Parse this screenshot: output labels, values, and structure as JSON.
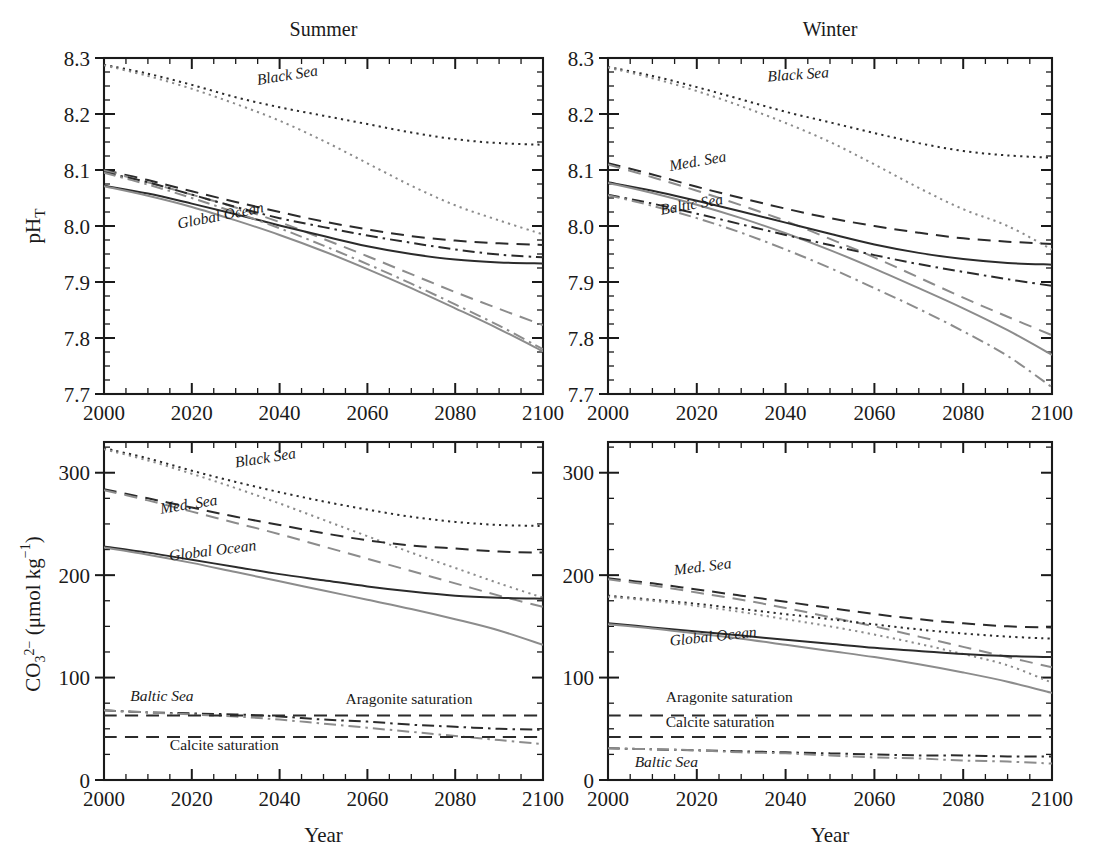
{
  "figure": {
    "panels": [
      {
        "id": "summer-ph",
        "title": "Summer",
        "x_axis_label": "",
        "y_axis_label": "pH_T"
      },
      {
        "id": "winter-ph",
        "title": "Winter",
        "x_axis_label": "",
        "y_axis_label": ""
      },
      {
        "id": "summer-co3",
        "title": "",
        "x_axis_label": "Year",
        "y_axis_label": "CO3 2- (umol kg-1)"
      },
      {
        "id": "winter-co3",
        "title": "",
        "x_axis_label": "Year",
        "y_axis_label": ""
      }
    ],
    "axis_titles": {
      "year": "Year",
      "ph": "pH",
      "ph_sub": "T",
      "co3": "CO",
      "co3_sup": "2−",
      "co3_sub": "3",
      "co3_units": "(μmol kg",
      "co3_units_sup": "−1",
      "co3_units_close": ")"
    },
    "colors": {
      "dark": "#2b2b2b",
      "light": "#8c8c8c",
      "axis": "#1a1a1a",
      "background": "#ffffff"
    }
  },
  "chart_data": [
    {
      "type": "line",
      "id": "summer-ph",
      "title": "Summer",
      "xlabel": "",
      "ylabel": "pH_T",
      "xlim": [
        2000,
        2100
      ],
      "ylim": [
        7.7,
        8.3
      ],
      "xticks": [
        2000,
        2020,
        2040,
        2060,
        2080,
        2100
      ],
      "yticks": [
        7.7,
        7.8,
        7.9,
        8.0,
        8.1,
        8.2,
        8.3
      ],
      "ytick_labels": [
        "7.7",
        "7.8",
        "7.9",
        "8.0",
        "8.1",
        "8.2",
        "8.3"
      ],
      "xtick_labels": [
        "2000",
        "2020",
        "2040",
        "2060",
        "2080",
        "2100"
      ],
      "minor_tick_step": 5,
      "grid": false,
      "legend": "inline-annotations",
      "annotations": [
        {
          "text": "Black Sea",
          "x": 2035,
          "y": 8.252,
          "rotation": -9,
          "style": "italic"
        },
        {
          "text": "Global Ocean",
          "x": 2017,
          "y": 7.995,
          "rotation": -11,
          "style": "italic"
        }
      ],
      "x": [
        2000,
        2010,
        2020,
        2030,
        2040,
        2050,
        2060,
        2070,
        2080,
        2090,
        2100
      ],
      "series": [
        {
          "name": "Black Sea (scenario A)",
          "style": "dotted",
          "shade": "dark",
          "values": [
            8.288,
            8.272,
            8.252,
            8.23,
            8.212,
            8.197,
            8.182,
            8.167,
            8.155,
            8.148,
            8.145
          ]
        },
        {
          "name": "Black Sea (scenario B)",
          "style": "dotted",
          "shade": "light",
          "values": [
            8.287,
            8.268,
            8.245,
            8.218,
            8.188,
            8.152,
            8.112,
            8.072,
            8.037,
            8.01,
            7.985
          ]
        },
        {
          "name": "Med. Sea (scenario A)",
          "style": "dashed",
          "shade": "dark",
          "values": [
            8.1,
            8.082,
            8.062,
            8.043,
            8.025,
            8.008,
            7.994,
            7.982,
            7.974,
            7.969,
            7.966
          ]
        },
        {
          "name": "Med. Sea (scenario B)",
          "style": "dashed",
          "shade": "light",
          "values": [
            8.099,
            8.078,
            8.056,
            8.033,
            8.007,
            7.977,
            7.946,
            7.914,
            7.882,
            7.852,
            7.823
          ]
        },
        {
          "name": "Global Ocean (scenario A)",
          "style": "solid",
          "shade": "dark",
          "values": [
            8.072,
            8.058,
            8.04,
            8.021,
            8.001,
            7.982,
            7.964,
            7.95,
            7.94,
            7.935,
            7.933
          ]
        },
        {
          "name": "Global Ocean (scenario B)",
          "style": "solid",
          "shade": "light",
          "values": [
            8.071,
            8.054,
            8.034,
            8.01,
            7.984,
            7.955,
            7.923,
            7.889,
            7.853,
            7.816,
            7.776
          ]
        },
        {
          "name": "Baltic Sea (scenario A)",
          "style": "dashdot",
          "shade": "dark",
          "values": [
            8.096,
            8.078,
            8.056,
            8.034,
            8.014,
            7.998,
            7.983,
            7.97,
            7.958,
            7.949,
            7.944
          ]
        },
        {
          "name": "Baltic Sea (scenario B)",
          "style": "dashdot",
          "shade": "light",
          "values": [
            8.095,
            8.074,
            8.05,
            8.024,
            7.996,
            7.965,
            7.932,
            7.897,
            7.86,
            7.822,
            7.78
          ]
        }
      ]
    },
    {
      "type": "line",
      "id": "winter-ph",
      "title": "Winter",
      "xlabel": "",
      "ylabel": "",
      "xlim": [
        2000,
        2100
      ],
      "ylim": [
        7.7,
        8.3
      ],
      "xticks": [
        2000,
        2020,
        2040,
        2060,
        2080,
        2100
      ],
      "yticks": [
        7.7,
        7.8,
        7.9,
        8.0,
        8.1,
        8.2,
        8.3
      ],
      "ytick_labels": [
        "7.7",
        "7.8",
        "7.9",
        "8.0",
        "8.1",
        "8.2",
        "8.3"
      ],
      "xtick_labels": [
        "2000",
        "2020",
        "2040",
        "2060",
        "2080",
        "2100"
      ],
      "minor_tick_step": 5,
      "grid": false,
      "legend": "inline-annotations",
      "annotations": [
        {
          "text": "Black Sea",
          "x": 2036,
          "y": 8.258,
          "rotation": -4,
          "style": "italic"
        },
        {
          "text": "Med. Sea",
          "x": 2014,
          "y": 8.098,
          "rotation": -10,
          "style": "italic"
        },
        {
          "text": "Baltic Sea",
          "x": 2012,
          "y": 8.02,
          "rotation": -10,
          "style": "italic"
        }
      ],
      "x": [
        2000,
        2010,
        2020,
        2030,
        2040,
        2050,
        2060,
        2070,
        2080,
        2090,
        2100
      ],
      "series": [
        {
          "name": "Black Sea (scenario A)",
          "style": "dotted",
          "shade": "dark",
          "values": [
            8.284,
            8.268,
            8.248,
            8.226,
            8.204,
            8.185,
            8.166,
            8.148,
            8.134,
            8.126,
            8.122
          ]
        },
        {
          "name": "Black Sea (scenario B)",
          "style": "dotted",
          "shade": "light",
          "values": [
            8.283,
            8.264,
            8.241,
            8.214,
            8.184,
            8.15,
            8.11,
            8.068,
            8.03,
            8.0,
            7.958
          ]
        },
        {
          "name": "Med. Sea (scenario A)",
          "style": "dashed",
          "shade": "dark",
          "values": [
            8.112,
            8.092,
            8.07,
            8.05,
            8.031,
            8.014,
            8.0,
            7.988,
            7.978,
            7.972,
            7.968
          ]
        },
        {
          "name": "Med. Sea (scenario B)",
          "style": "dashed",
          "shade": "light",
          "values": [
            8.11,
            8.087,
            8.063,
            8.037,
            8.009,
            7.977,
            7.944,
            7.908,
            7.872,
            7.838,
            7.805
          ]
        },
        {
          "name": "Global Ocean (scenario A)",
          "style": "solid",
          "shade": "dark",
          "values": [
            8.078,
            8.063,
            8.045,
            8.026,
            8.006,
            7.986,
            7.967,
            7.952,
            7.941,
            7.934,
            7.931
          ]
        },
        {
          "name": "Global Ocean (scenario B)",
          "style": "solid",
          "shade": "light",
          "values": [
            8.077,
            8.059,
            8.038,
            8.014,
            7.987,
            7.957,
            7.924,
            7.889,
            7.853,
            7.814,
            7.77
          ]
        },
        {
          "name": "Baltic Sea (scenario A)",
          "style": "dashdot",
          "shade": "dark",
          "values": [
            8.056,
            8.04,
            8.022,
            8.003,
            7.984,
            7.966,
            7.948,
            7.932,
            7.918,
            7.905,
            7.893
          ]
        },
        {
          "name": "Baltic Sea (scenario B)",
          "style": "dashdot",
          "shade": "light",
          "values": [
            8.055,
            8.036,
            8.014,
            7.988,
            7.958,
            7.925,
            7.889,
            7.852,
            7.812,
            7.768,
            7.712
          ]
        }
      ]
    },
    {
      "type": "line",
      "id": "summer-co3",
      "title": "",
      "xlabel": "Year",
      "ylabel": "CO3 2- (umol kg-1)",
      "xlim": [
        2000,
        2100
      ],
      "ylim": [
        0,
        330
      ],
      "xticks": [
        2000,
        2020,
        2040,
        2060,
        2080,
        2100
      ],
      "yticks": [
        0,
        100,
        200,
        300
      ],
      "ytick_labels": [
        "0",
        "100",
        "200",
        "300"
      ],
      "xtick_labels": [
        "2000",
        "2020",
        "2040",
        "2060",
        "2080",
        "2100"
      ],
      "minor_tick_step": 5,
      "minor_tick_y": 25,
      "grid": false,
      "legend": "inline-annotations",
      "annotations": [
        {
          "text": "Black Sea",
          "x": 2030,
          "y": 305,
          "rotation": -9,
          "style": "italic"
        },
        {
          "text": "Med. Sea",
          "x": 2013,
          "y": 260,
          "rotation": -9,
          "style": "italic"
        },
        {
          "text": "Global Ocean",
          "x": 2015,
          "y": 214,
          "rotation": -7,
          "style": "italic"
        },
        {
          "text": "Baltic Sea",
          "x": 2006,
          "y": 77,
          "rotation": 0,
          "style": "italic"
        },
        {
          "text": "Aragonite saturation",
          "x": 2055,
          "y": 74,
          "rotation": 0,
          "style": "normal"
        },
        {
          "text": "Calcite saturation",
          "x": 2015,
          "y": 29,
          "rotation": 0,
          "style": "normal"
        }
      ],
      "x": [
        2000,
        2010,
        2020,
        2030,
        2040,
        2050,
        2060,
        2070,
        2080,
        2090,
        2100
      ],
      "series": [
        {
          "name": "Black Sea (scenario A)",
          "style": "dotted",
          "shade": "dark",
          "values": [
            324,
            314,
            302,
            291,
            281,
            272,
            264,
            257,
            252,
            249,
            248
          ]
        },
        {
          "name": "Black Sea (scenario B)",
          "style": "dotted",
          "shade": "light",
          "values": [
            323,
            312,
            299,
            285,
            270,
            254,
            238,
            222,
            207,
            192,
            178
          ]
        },
        {
          "name": "Med. Sea (scenario A)",
          "style": "dashed",
          "shade": "dark",
          "values": [
            284,
            275,
            266,
            257,
            249,
            241,
            234,
            229,
            226,
            223,
            222
          ]
        },
        {
          "name": "Med. Sea (scenario B)",
          "style": "dashed",
          "shade": "light",
          "values": [
            283,
            273,
            262,
            251,
            240,
            228,
            216,
            204,
            192,
            180,
            169
          ]
        },
        {
          "name": "Global Ocean (scenario A)",
          "style": "solid",
          "shade": "dark",
          "values": [
            228,
            222,
            215,
            208,
            201,
            195,
            189,
            184,
            180,
            178,
            177
          ]
        },
        {
          "name": "Global Ocean (scenario B)",
          "style": "solid",
          "shade": "light",
          "values": [
            227,
            220,
            212,
            203,
            194,
            185,
            176,
            167,
            157,
            146,
            132
          ]
        },
        {
          "name": "Baltic Sea (scenario A)",
          "style": "dashdot",
          "shade": "dark",
          "values": [
            68,
            66,
            65,
            64,
            62,
            59,
            57,
            54,
            52,
            50,
            49
          ]
        },
        {
          "name": "Baltic Sea (scenario B)",
          "style": "dashdot",
          "shade": "light",
          "values": [
            68,
            66,
            64,
            62,
            59,
            55,
            51,
            47,
            43,
            39,
            35
          ]
        },
        {
          "name": "Aragonite saturation",
          "style": "dashed",
          "shade": "dark",
          "values": [
            63,
            63,
            63,
            63,
            63,
            63,
            63,
            63,
            63,
            63,
            63
          ]
        },
        {
          "name": "Calcite saturation",
          "style": "dashed",
          "shade": "dark",
          "values": [
            42,
            42,
            42,
            42,
            42,
            42,
            42,
            42,
            42,
            42,
            42
          ]
        }
      ]
    },
    {
      "type": "line",
      "id": "winter-co3",
      "title": "",
      "xlabel": "Year",
      "ylabel": "",
      "xlim": [
        2000,
        2100
      ],
      "ylim": [
        0,
        330
      ],
      "xticks": [
        2000,
        2020,
        2040,
        2060,
        2080,
        2100
      ],
      "yticks": [
        0,
        100,
        200,
        300
      ],
      "ytick_labels": [
        "0",
        "100",
        "200",
        "300"
      ],
      "xtick_labels": [
        "2000",
        "2020",
        "2040",
        "2060",
        "2080",
        "2100"
      ],
      "minor_tick_step": 5,
      "minor_tick_y": 25,
      "grid": false,
      "legend": "inline-annotations",
      "annotations": [
        {
          "text": "Med. Sea",
          "x": 2015,
          "y": 200,
          "rotation": -7,
          "style": "italic"
        },
        {
          "text": "Global Ocean",
          "x": 2014,
          "y": 131,
          "rotation": -6,
          "style": "italic"
        },
        {
          "text": "Aragonite saturation",
          "x": 2013,
          "y": 76,
          "rotation": 0,
          "style": "normal"
        },
        {
          "text": "Calcite saturation",
          "x": 2013,
          "y": 52,
          "rotation": 0,
          "style": "normal"
        },
        {
          "text": "Baltic Sea",
          "x": 2006,
          "y": 13,
          "rotation": 0,
          "style": "italic"
        }
      ],
      "x": [
        2000,
        2010,
        2020,
        2030,
        2040,
        2050,
        2060,
        2070,
        2080,
        2090,
        2100
      ],
      "series": [
        {
          "name": "Med. Sea (scenario A)",
          "style": "dashed",
          "shade": "dark",
          "values": [
            197,
            192,
            186,
            180,
            174,
            168,
            162,
            157,
            153,
            150,
            149
          ]
        },
        {
          "name": "Med. Sea (scenario B)",
          "style": "dashed",
          "shade": "light",
          "values": [
            196,
            190,
            183,
            176,
            168,
            159,
            150,
            140,
            130,
            120,
            110
          ]
        },
        {
          "name": "Black Sea (scenario A)",
          "style": "dotted",
          "shade": "dark",
          "values": [
            180,
            176,
            172,
            167,
            162,
            157,
            152,
            147,
            143,
            140,
            138
          ]
        },
        {
          "name": "Black Sea (scenario B)",
          "style": "dotted",
          "shade": "light",
          "values": [
            179,
            175,
            170,
            164,
            157,
            150,
            142,
            133,
            123,
            112,
            95
          ]
        },
        {
          "name": "Global Ocean (scenario A)",
          "style": "solid",
          "shade": "dark",
          "values": [
            153,
            149,
            145,
            141,
            137,
            133,
            129,
            126,
            123,
            121,
            120
          ]
        },
        {
          "name": "Global Ocean (scenario B)",
          "style": "solid",
          "shade": "light",
          "values": [
            152,
            148,
            143,
            138,
            132,
            126,
            120,
            113,
            105,
            96,
            85
          ]
        },
        {
          "name": "Baltic Sea (scenario A)",
          "style": "dashdot",
          "shade": "dark",
          "values": [
            31,
            30,
            29,
            28,
            27,
            26,
            25,
            24,
            24,
            23,
            23
          ]
        },
        {
          "name": "Baltic Sea (scenario B)",
          "style": "dashdot",
          "shade": "light",
          "values": [
            31,
            30,
            29,
            27,
            26,
            24,
            22,
            21,
            19,
            18,
            16
          ]
        },
        {
          "name": "Aragonite saturation",
          "style": "dashed",
          "shade": "dark",
          "values": [
            63,
            63,
            63,
            63,
            63,
            63,
            63,
            63,
            63,
            63,
            63
          ]
        },
        {
          "name": "Calcite saturation",
          "style": "dashed",
          "shade": "dark",
          "values": [
            42,
            42,
            42,
            42,
            42,
            42,
            42,
            42,
            42,
            42,
            42
          ]
        }
      ]
    }
  ]
}
